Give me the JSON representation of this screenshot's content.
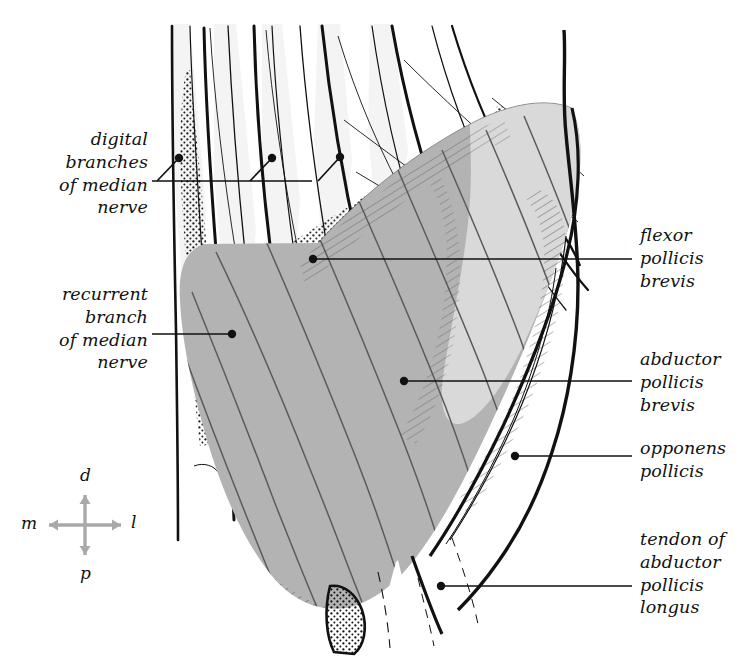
{
  "figure": {
    "type": "anatomical-illustration",
    "background_color": "#ffffff",
    "ink_color": "#111111",
    "muscle_fill": "#b3b3b3",
    "muscle_fill_light": "#d9d9d9",
    "compass_arrow_color": "#a9a9a9"
  },
  "labels": {
    "digital_branches": {
      "lines": [
        "digital",
        "branches",
        "of median",
        "nerve"
      ],
      "align": "right",
      "x": 148,
      "y": 128,
      "leader": {
        "y": 181,
        "x_start": 152,
        "x_end": 312,
        "dots": [
          [
            179,
            158
          ],
          [
            272,
            158
          ],
          [
            340,
            157
          ]
        ]
      }
    },
    "recurrent_branch": {
      "lines": [
        "recurrent",
        "branch",
        "of median",
        "nerve"
      ],
      "align": "right",
      "x": 148,
      "y": 283,
      "leader": {
        "y": 334,
        "x_start": 152,
        "x_end": 232,
        "dots": [
          [
            232,
            334
          ]
        ]
      }
    },
    "flexor_pollicis_brevis": {
      "lines": [
        "flexor",
        "pollicis",
        "brevis"
      ],
      "align": "left",
      "x": 640,
      "y": 224,
      "leader": {
        "y": 259,
        "x_start": 313,
        "x_end": 632,
        "dots": [
          [
            313,
            259
          ]
        ]
      }
    },
    "abductor_pollicis_brevis": {
      "lines": [
        "abductor",
        "pollicis",
        "brevis"
      ],
      "align": "left",
      "x": 640,
      "y": 348,
      "leader": {
        "y": 381,
        "x_start": 404,
        "x_end": 632,
        "dots": [
          [
            404,
            381
          ]
        ]
      }
    },
    "opponens_pollicis": {
      "lines": [
        "opponens",
        "pollicis"
      ],
      "align": "left",
      "x": 640,
      "y": 437,
      "leader": {
        "y": 456,
        "x_start": 515,
        "x_end": 632,
        "dots": [
          [
            515,
            456
          ]
        ]
      }
    },
    "tendon_of_abductor_pollicis_longus": {
      "lines": [
        "tendon of",
        "abductor",
        "pollicis",
        "longus"
      ],
      "align": "left",
      "x": 640,
      "y": 528,
      "leader": {
        "y": 586,
        "x_start": 441,
        "x_end": 632,
        "dots": [
          [
            441,
            586
          ]
        ]
      }
    }
  },
  "compass": {
    "center_x": 85,
    "center_y": 525,
    "arm": 30,
    "letters": {
      "distal": "d",
      "medial": "m",
      "lateral": "l",
      "proximal": "p"
    }
  }
}
